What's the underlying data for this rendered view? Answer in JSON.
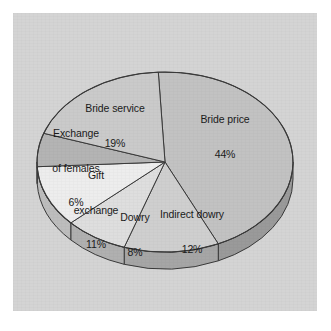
{
  "figure": {
    "background_color": "#ffffff",
    "panel_color": "#d4d4d4",
    "outline_color": "#3a3a3a"
  },
  "chart_data": {
    "type": "pie",
    "title": "",
    "subtitle": "",
    "xlabel": "",
    "ylabel": "",
    "legend_position": "none",
    "grid": false,
    "style": "3d-pie",
    "units": "percent",
    "total": 100,
    "categories": [
      "Bride price",
      "Indirect dowry",
      "Dowry",
      "Gift exchange",
      "Exchange of females",
      "Bride service"
    ],
    "values": [
      44,
      12,
      8,
      11,
      6,
      19
    ],
    "slices": [
      {
        "label": "Bride price",
        "value": 44,
        "value_text": "44%",
        "label_line1": "Bride price",
        "label_line2": "44%",
        "color": "#c2c2c2",
        "wall_color": "#9a9a9a"
      },
      {
        "label": "Indirect dowry",
        "value": 12,
        "value_text": "12%",
        "label_line1": "Indirect dowry",
        "label_line2": "12%",
        "color": "#cfcfcf",
        "wall_color": "#a6a6a6"
      },
      {
        "label": "Dowry",
        "value": 8,
        "value_text": "8%",
        "label_line1": "Dowry",
        "label_line2": "8%",
        "color": "#dedede",
        "wall_color": "#b0b0b0"
      },
      {
        "label": "Gift exchange",
        "value": 11,
        "value_text": "11%",
        "label_line1": "Gift",
        "label_line2": "exchange",
        "label_line3": "11%",
        "color": "#ededed",
        "wall_color": "#bdbdbd"
      },
      {
        "label": "Exchange of females",
        "value": 6,
        "value_text": "6%",
        "label_line1": "Exchange",
        "label_line2": "of females",
        "label_line3": "6%",
        "color": "#b4b4b4",
        "wall_color": "#909090"
      },
      {
        "label": "Bride service",
        "value": 19,
        "value_text": "19%",
        "label_line1": "Bride service",
        "label_line2": "19%",
        "color": "#cacaca",
        "wall_color": "#a0a0a0"
      }
    ]
  }
}
